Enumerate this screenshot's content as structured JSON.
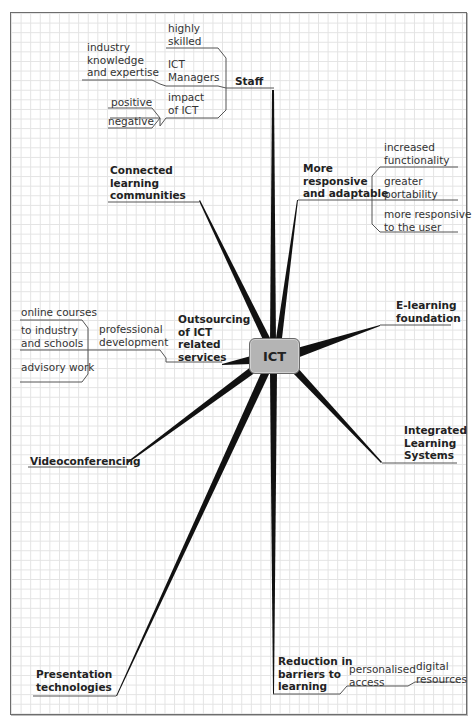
{
  "diagram": {
    "type": "mind-map",
    "center": {
      "label": "ICT",
      "fill": "#b4b4b4"
    },
    "branches": [
      {
        "label": "Staff",
        "children": [
          {
            "label": "ICT Managers",
            "children": [
              {
                "label": "highly skilled"
              },
              {
                "label": "industry knowledge and expertise"
              }
            ]
          },
          {
            "label": "impact of ICT",
            "children": [
              {
                "label": "positive"
              },
              {
                "label": "negative"
              }
            ]
          }
        ]
      },
      {
        "label": "More responsive and adaptable",
        "children": [
          {
            "label": "increased functionality"
          },
          {
            "label": "greater portability"
          },
          {
            "label": "more responsive to the user"
          }
        ]
      },
      {
        "label": "Connected learning communities",
        "children": []
      },
      {
        "label": "Outsourcing of ICT related services",
        "children": [
          {
            "label": "professional development",
            "children": [
              {
                "label": "online courses"
              },
              {
                "label": "to industry and schools"
              },
              {
                "label": "advisory work"
              }
            ]
          }
        ]
      },
      {
        "label": "E-learning foundation",
        "children": []
      },
      {
        "label": "Integrated Learning Systems",
        "children": []
      },
      {
        "label": "Videoconferencing",
        "children": []
      },
      {
        "label": "Presentation technologies",
        "children": []
      },
      {
        "label": "Reduction in barriers to learning",
        "children": [
          {
            "label": "personalised access",
            "children": [
              {
                "label": "digital resources"
              }
            ]
          }
        ]
      }
    ]
  },
  "labels": {
    "center": "ICT",
    "staff": "Staff",
    "highly_skilled": "highly\nskilled",
    "ict_managers": "ICT\nManagers",
    "industry_knowledge": "industry\nknowledge\nand expertise",
    "impact_of_ict": "impact\nof ICT",
    "positive": "positive",
    "negative": "negative",
    "more_responsive": "More\nresponsive\nand adaptable",
    "increased_functionality": "increased\nfunctionality",
    "greater_portability": "greater\nportability",
    "more_responsive_user": "more responsive\nto the user",
    "connected_learning": "Connected\nlearning\ncommunities",
    "outsourcing": "Outsourcing\nof ICT\nrelated\nservices",
    "professional_development": "professional\ndevelopment",
    "online_courses": "online courses",
    "to_industry": "to industry\nand schools",
    "advisory_work": "advisory work",
    "elearning": "E-learning\nfoundation",
    "integrated": "Integrated\nLearning\nSystems",
    "videoconferencing": "Videoconferencing",
    "presentation": "Presentation\ntechnologies",
    "reduction": "Reduction in\nbarriers to\nlearning",
    "personalised_access": "personalised\naccess",
    "digital_resources": "digital\nresources"
  },
  "colors": {
    "spoke": "#111111",
    "connector": "#555555",
    "grid": "#e3e3e3",
    "frame": "#6d6d6d"
  }
}
